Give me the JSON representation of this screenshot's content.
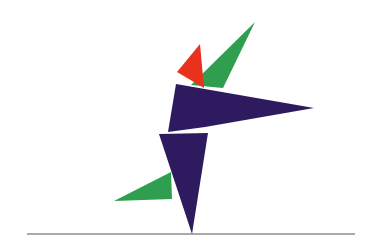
{
  "artwork": {
    "description": "Abstract geometric figure composed of triangles on a horizontal baseline",
    "colors": {
      "background": "#ffffff",
      "purple": "#2e1a5e",
      "green": "#2f9e4f",
      "red": "#e8321e",
      "line": "#555555"
    }
  }
}
